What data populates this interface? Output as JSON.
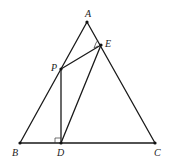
{
  "diagram": {
    "type": "geometry",
    "points": {
      "A": {
        "label": "A",
        "x": 87,
        "y": 22
      },
      "B": {
        "label": "B",
        "x": 20,
        "y": 143
      },
      "C": {
        "label": "C",
        "x": 155,
        "y": 143
      },
      "D": {
        "label": "D",
        "x": 61,
        "y": 143
      },
      "E": {
        "label": "E",
        "x": 101,
        "y": 45
      },
      "P": {
        "label": "P",
        "x": 61,
        "y": 69
      }
    },
    "segments": [
      "AB",
      "AC",
      "BC",
      "PE",
      "PD",
      "DE"
    ],
    "right_angles": [
      "PDB",
      "PEA"
    ],
    "stroke_color": "#1a1a1a"
  }
}
